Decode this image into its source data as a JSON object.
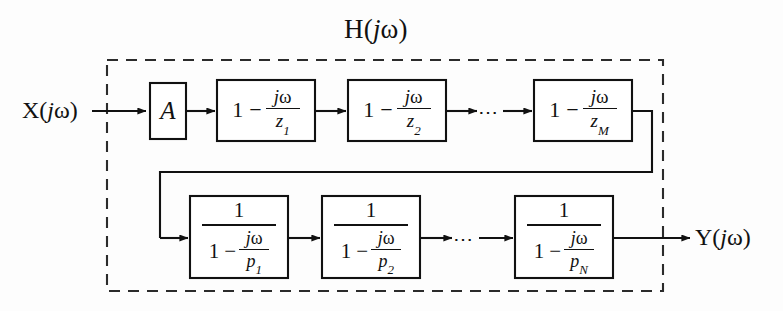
{
  "diagram": {
    "system_label": {
      "fn": "H",
      "open": "(",
      "j": "j",
      "omega": "ω",
      "close": ")"
    },
    "input_port": {
      "fn": "X",
      "open": "(",
      "j": "j",
      "omega": "ω",
      "close": ")"
    },
    "output_port": {
      "fn": "Y",
      "open": "(",
      "j": "j",
      "omega": "ω",
      "close": ")"
    },
    "gain_block": {
      "label": "A"
    },
    "ellipsis": "⋯",
    "top_row": {
      "one": "1",
      "minus": "−",
      "numerator_j": "j",
      "numerator_omega": "ω",
      "blocks": [
        {
          "denominator_base": "z",
          "denominator_sub": "1"
        },
        {
          "denominator_base": "z",
          "denominator_sub": "2"
        },
        {
          "denominator_base": "z",
          "denominator_sub": "M"
        }
      ]
    },
    "bottom_row": {
      "outer_numerator": "1",
      "one": "1",
      "minus": "−",
      "numerator_j": "j",
      "numerator_omega": "ω",
      "blocks": [
        {
          "denominator_base": "p",
          "denominator_sub": "1"
        },
        {
          "denominator_base": "p",
          "denominator_sub": "2"
        },
        {
          "denominator_base": "p",
          "denominator_sub": "N"
        }
      ]
    },
    "colors": {
      "ink": "#111111",
      "background": "#fdfdfd",
      "boundary": "#2b2b2b"
    }
  }
}
